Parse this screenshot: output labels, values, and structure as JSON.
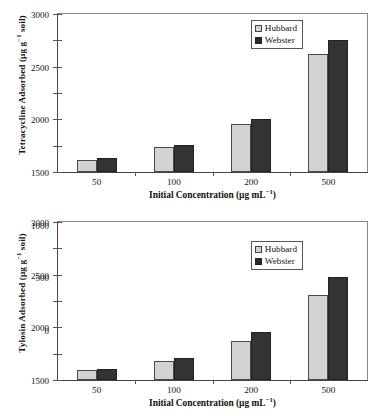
{
  "figure": {
    "width": 378,
    "height": 416,
    "background": "#ffffff"
  },
  "colors": {
    "hubbard": "#d2d2d2",
    "webster": "#333333",
    "axis": "#444444",
    "frame": "#888888"
  },
  "legend": {
    "position": "top-right-inside",
    "entries": [
      {
        "label": "Hubbard",
        "swatch": "light-gray-square",
        "color": "#d2d2d2"
      },
      {
        "label": "Webster",
        "swatch": "dark-filled-square",
        "color": "#333333"
      }
    ]
  },
  "axis": {
    "y_ticks": [
      "0",
      "500",
      "1000",
      "1500",
      "2000",
      "2500",
      "3000"
    ],
    "x_ticks": [
      "50",
      "100",
      "200",
      "500"
    ],
    "xlabel_main": "Initial Concentration (µg mL",
    "xlabel_sup": "−1",
    "xlabel_tail": ")"
  },
  "chart_data": [
    {
      "id": "tetracycline",
      "type": "bar",
      "title": "",
      "xlabel": "Initial Concentration (µg mL⁻¹)",
      "ylabel": "Tetracycline Adsorbed (µg g⁻¹ soil)",
      "ylabel_main": "Tetracycline Adsorbed (µg g",
      "ylabel_sup": "−1",
      "ylabel_tail": " soil)",
      "categories": [
        "50",
        "100",
        "200",
        "500"
      ],
      "series": [
        {
          "name": "Hubbard",
          "color": "#d2d2d2",
          "values": [
            225,
            470,
            920,
            2240
          ]
        },
        {
          "name": "Webster",
          "color": "#333333",
          "values": [
            260,
            510,
            1015,
            2500
          ]
        }
      ],
      "ylim": [
        0,
        3000
      ],
      "ytick_step": 500,
      "grid": false,
      "legend_position": "upper-center-right"
    },
    {
      "id": "tylosin",
      "type": "bar",
      "title": "",
      "xlabel": "Initial Concentration (µg mL⁻¹)",
      "ylabel": "Tylosin Adsorbed (µg g⁻¹ soil)",
      "ylabel_main": "Tylosin Adsorbed (µg g",
      "ylabel_sup": "−1",
      "ylabel_tail": " soil)",
      "categories": [
        "50",
        "100",
        "200",
        "500"
      ],
      "series": [
        {
          "name": "Hubbard",
          "color": "#d2d2d2",
          "values": [
            190,
            365,
            735,
            1615
          ]
        },
        {
          "name": "Webster",
          "color": "#333333",
          "values": [
            210,
            420,
            905,
            1950
          ]
        }
      ],
      "ylim": [
        0,
        3000
      ],
      "ytick_step": 500,
      "grid": false,
      "legend_position": "upper-center-right"
    }
  ]
}
